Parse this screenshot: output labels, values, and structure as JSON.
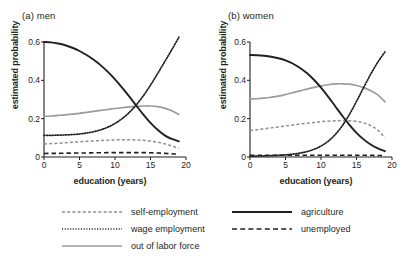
{
  "figure": {
    "panels": [
      {
        "title": "(a) men",
        "xlabel": "education (years)",
        "ylabel": "estimated probability"
      },
      {
        "title": "(b) women",
        "xlabel": "education (years)",
        "ylabel": "estimated probability"
      }
    ],
    "legend": {
      "left": [
        {
          "label": "self-employment",
          "style": "dashed-gray",
          "color": "#8f8f8f"
        },
        {
          "label": "wage employment",
          "style": "dotted-black",
          "color": "#231f20"
        },
        {
          "label": "out of labor force",
          "style": "solid-gray",
          "color": "#9b9b9b"
        }
      ],
      "right": [
        {
          "label": "agriculture",
          "style": "solid-black",
          "color": "#231f20"
        },
        {
          "label": "unemployed",
          "style": "long-dashed-black",
          "color": "#231f20"
        }
      ]
    }
  },
  "chart_data": [
    {
      "type": "line",
      "title": "(a) men",
      "xlabel": "education (years)",
      "ylabel": "estimated probability",
      "xlim": [
        0,
        20
      ],
      "ylim": [
        0,
        0.6
      ],
      "xticks": [
        0,
        5,
        10,
        15,
        20
      ],
      "yticks": [
        0,
        0.2,
        0.4,
        0.6
      ],
      "ytick_labels": [
        "0",
        "0.2",
        "0.4",
        "0.6"
      ],
      "grid": false,
      "legend_position": "bottom",
      "x": [
        0,
        1,
        2,
        3,
        4,
        5,
        6,
        7,
        8,
        9,
        10,
        11,
        12,
        13,
        14,
        15,
        16,
        17,
        18,
        19
      ],
      "series": [
        {
          "name": "agriculture",
          "style": "solid-black",
          "color": "#231f20",
          "values": [
            0.6,
            0.598,
            0.592,
            0.583,
            0.57,
            0.553,
            0.532,
            0.507,
            0.478,
            0.444,
            0.405,
            0.362,
            0.316,
            0.268,
            0.221,
            0.178,
            0.142,
            0.113,
            0.094,
            0.082
          ]
        },
        {
          "name": "wage employment",
          "style": "dotted-black",
          "color": "#231f20",
          "values": [
            0.113,
            0.113,
            0.114,
            0.115,
            0.117,
            0.12,
            0.125,
            0.132,
            0.142,
            0.156,
            0.175,
            0.2,
            0.232,
            0.272,
            0.32,
            0.375,
            0.435,
            0.497,
            0.56,
            0.625
          ]
        },
        {
          "name": "out of labor force",
          "style": "solid-gray",
          "color": "#9b9b9b",
          "values": [
            0.212,
            0.214,
            0.217,
            0.22,
            0.224,
            0.228,
            0.233,
            0.238,
            0.243,
            0.248,
            0.253,
            0.257,
            0.261,
            0.264,
            0.266,
            0.266,
            0.263,
            0.255,
            0.241,
            0.222
          ]
        },
        {
          "name": "self-employment",
          "style": "dashed-gray",
          "color": "#8f8f8f",
          "values": [
            0.068,
            0.07,
            0.072,
            0.074,
            0.077,
            0.079,
            0.082,
            0.084,
            0.086,
            0.088,
            0.089,
            0.09,
            0.09,
            0.089,
            0.087,
            0.083,
            0.077,
            0.069,
            0.058,
            0.044
          ]
        },
        {
          "name": "unemployed",
          "style": "long-dashed-black",
          "color": "#231f20",
          "values": [
            0.018,
            0.019,
            0.019,
            0.02,
            0.02,
            0.021,
            0.021,
            0.022,
            0.022,
            0.023,
            0.023,
            0.023,
            0.023,
            0.023,
            0.023,
            0.022,
            0.021,
            0.019,
            0.017,
            0.014
          ]
        }
      ]
    },
    {
      "type": "line",
      "title": "(b) women",
      "xlabel": "education (years)",
      "ylabel": "estimated probability",
      "xlim": [
        0,
        20
      ],
      "ylim": [
        0,
        0.6
      ],
      "xticks": [
        0,
        5,
        10,
        15,
        20
      ],
      "yticks": [
        0,
        0.2,
        0.4,
        0.6
      ],
      "ytick_labels": [
        "0",
        "0.2",
        "0.4",
        "0.6"
      ],
      "grid": false,
      "legend_position": "bottom",
      "x": [
        0,
        1,
        2,
        3,
        4,
        5,
        6,
        7,
        8,
        9,
        10,
        11,
        12,
        13,
        14,
        15,
        16,
        17,
        18,
        19
      ],
      "series": [
        {
          "name": "agriculture",
          "style": "solid-black",
          "color": "#231f20",
          "values": [
            0.532,
            0.531,
            0.528,
            0.523,
            0.515,
            0.504,
            0.488,
            0.466,
            0.438,
            0.403,
            0.362,
            0.315,
            0.265,
            0.215,
            0.168,
            0.126,
            0.092,
            0.065,
            0.045,
            0.03
          ]
        },
        {
          "name": "wage employment",
          "style": "dotted-black",
          "color": "#231f20",
          "values": [
            0.005,
            0.005,
            0.006,
            0.007,
            0.009,
            0.011,
            0.015,
            0.02,
            0.028,
            0.04,
            0.057,
            0.082,
            0.117,
            0.163,
            0.222,
            0.29,
            0.362,
            0.432,
            0.495,
            0.548
          ]
        },
        {
          "name": "out of labor force",
          "style": "solid-gray",
          "color": "#9b9b9b",
          "values": [
            0.303,
            0.304,
            0.307,
            0.312,
            0.318,
            0.326,
            0.335,
            0.345,
            0.354,
            0.363,
            0.371,
            0.377,
            0.381,
            0.382,
            0.38,
            0.373,
            0.362,
            0.346,
            0.324,
            0.288
          ]
        },
        {
          "name": "self-employment",
          "style": "dashed-gray",
          "color": "#8f8f8f",
          "values": [
            0.138,
            0.142,
            0.147,
            0.152,
            0.157,
            0.162,
            0.167,
            0.172,
            0.176,
            0.18,
            0.184,
            0.187,
            0.189,
            0.19,
            0.189,
            0.186,
            0.178,
            0.164,
            0.14,
            0.1
          ]
        },
        {
          "name": "unemployed",
          "style": "long-dashed-black",
          "color": "#231f20",
          "values": [
            0.009,
            0.009,
            0.009,
            0.009,
            0.009,
            0.009,
            0.009,
            0.009,
            0.009,
            0.009,
            0.009,
            0.009,
            0.009,
            0.009,
            0.009,
            0.009,
            0.009,
            0.009,
            0.008,
            0.008
          ]
        }
      ]
    }
  ]
}
